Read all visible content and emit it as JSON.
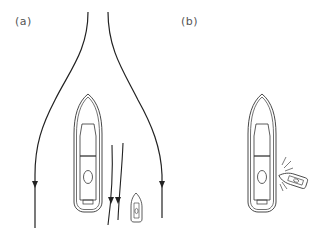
{
  "panels": [
    {
      "label": "(a)",
      "description": "Large vessel underway with flow lines diverging around bow; small boat nearby on starboard side",
      "elements": [
        "flow-line-left",
        "flow-line-right",
        "large-vessel",
        "inner-flow-line-1",
        "inner-flow-line-2",
        "small-boat"
      ]
    },
    {
      "label": "(b)",
      "description": "Small boat drawn into and colliding with large vessel's side",
      "elements": [
        "large-vessel",
        "small-boat-collision",
        "impact-marks"
      ]
    }
  ],
  "colors": {
    "stroke": "#333333",
    "label": "#555555",
    "background": "#ffffff"
  }
}
